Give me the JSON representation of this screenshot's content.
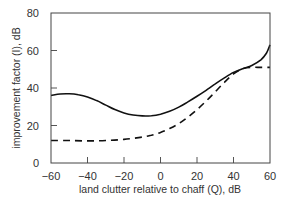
{
  "chart_data": {
    "type": "line",
    "title": "",
    "xlabel": "land clutter relative to chaff (Q), dB",
    "ylabel": "improvement factor (I), dB",
    "xlim": [
      -60,
      60
    ],
    "ylim": [
      0,
      80
    ],
    "xticks": [
      -60,
      -40,
      -20,
      0,
      20,
      40,
      60
    ],
    "yticks": [
      0,
      20,
      40,
      60,
      80
    ],
    "grid": false,
    "legend": null,
    "series": [
      {
        "name": "solid",
        "style": "solid",
        "x": [
          -60,
          -55,
          -50,
          -45,
          -40,
          -35,
          -30,
          -25,
          -20,
          -15,
          -10,
          -5,
          0,
          5,
          10,
          15,
          20,
          25,
          30,
          35,
          40,
          45,
          50,
          55,
          58,
          60
        ],
        "y": [
          36,
          36.8,
          36.9,
          36.4,
          35.2,
          33.3,
          30.9,
          28.5,
          26.7,
          25.6,
          25.1,
          25.2,
          26,
          27.6,
          29.8,
          32.6,
          35.6,
          38.8,
          42.2,
          45.4,
          48.3,
          50.3,
          52,
          55,
          58.5,
          63
        ]
      },
      {
        "name": "dashed",
        "style": "dashed",
        "x": [
          -60,
          -50,
          -40,
          -30,
          -20,
          -10,
          -5,
          0,
          5,
          10,
          15,
          20,
          25,
          30,
          35,
          40,
          45,
          50,
          55,
          60
        ],
        "y": [
          12,
          12,
          11.8,
          12,
          12.6,
          13.8,
          14.8,
          16.3,
          18.4,
          21,
          24.5,
          28.5,
          33,
          38,
          43,
          47.5,
          50.3,
          51,
          51,
          51
        ]
      }
    ]
  },
  "labels": {
    "xlabel": "land clutter relative to chaff (Q), dB",
    "ylabel": "improvement factor (I), dB",
    "xticks": [
      "−60",
      "−40",
      "−20",
      "0",
      "20",
      "40",
      "60"
    ],
    "yticks": [
      "0",
      "20",
      "40",
      "60",
      "80"
    ]
  }
}
